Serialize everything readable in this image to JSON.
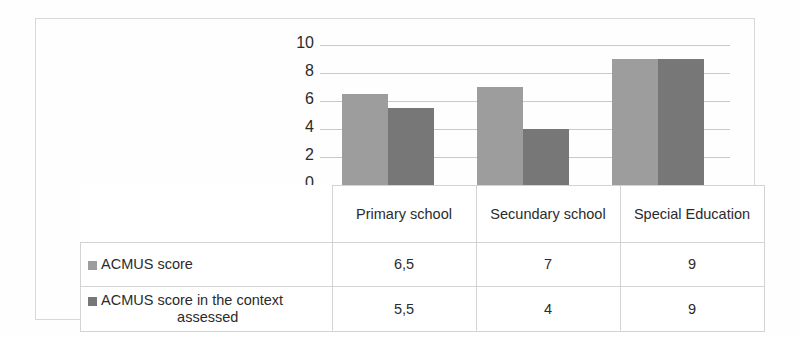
{
  "chart_data": {
    "type": "bar",
    "title": "",
    "xlabel": "",
    "ylabel": "",
    "ylim": [
      0,
      10
    ],
    "yticks": [
      10,
      8,
      6,
      4,
      2,
      0
    ],
    "grid": true,
    "legend_position": "data-table",
    "categories": [
      "Primary school",
      "Secundary school",
      "Special Education"
    ],
    "series": [
      {
        "name": "ACMUS score",
        "color": "#9d9d9d",
        "values": [
          6.5,
          7,
          9
        ],
        "value_labels": [
          "6,5",
          "7",
          "9"
        ]
      },
      {
        "name": "ACMUS score in the context assessed",
        "color": "#777777",
        "values": [
          5.5,
          4,
          9
        ],
        "value_labels": [
          "5,5",
          "4",
          "9"
        ]
      }
    ]
  },
  "table": {
    "column_headers": [
      "Primary school",
      "Secundary school",
      "Special Education"
    ],
    "rows": [
      {
        "label": "ACMUS score",
        "swatch": "legend-swatch-icon",
        "cells": [
          "6,5",
          "7",
          "9"
        ]
      },
      {
        "label_line1": "ACMUS score in the context",
        "label_line2": "assessed",
        "swatch": "legend-swatch-icon",
        "cells": [
          "5,5",
          "4",
          "9"
        ]
      }
    ]
  },
  "axis": {
    "ticks": [
      "10",
      "8",
      "6",
      "4",
      "2",
      "0"
    ]
  },
  "colors": {
    "series_1": "#9d9d9d",
    "series_2": "#777777",
    "gridline": "#c9c9c9",
    "border": "#d3d3d3",
    "frame": "#d8d8d8",
    "background": "#fefefe"
  }
}
